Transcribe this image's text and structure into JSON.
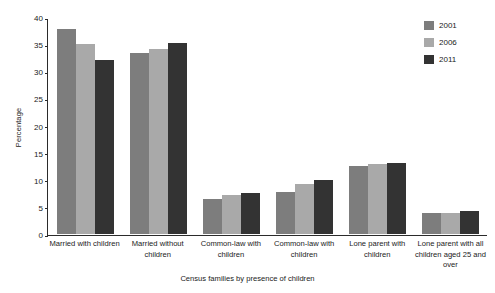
{
  "chart_data": {
    "type": "bar",
    "title": "",
    "xlabel": "Census families by presence of children",
    "ylabel": "Percentage",
    "ylim": [
      0,
      40
    ],
    "yticks": [
      0,
      5,
      10,
      15,
      20,
      25,
      30,
      35,
      40
    ],
    "grid": false,
    "legend_position": "top-right",
    "categories": [
      "Married with children",
      "Married without children",
      "Common-law with children",
      "Common-law with children",
      "Lone parent with children",
      "Lone parent with all children aged 25 and over"
    ],
    "series": [
      {
        "name": "2001",
        "color": "#7d7d7d",
        "values": [
          37.7,
          33.4,
          6.4,
          7.8,
          12.6,
          3.8
        ]
      },
      {
        "name": "2006",
        "color": "#a9a9a9",
        "values": [
          35.0,
          34.1,
          7.2,
          9.2,
          12.9,
          3.9
        ]
      },
      {
        "name": "2011",
        "color": "#333333",
        "values": [
          32.1,
          35.3,
          7.6,
          9.9,
          13.1,
          4.3
        ]
      }
    ]
  },
  "axis": {
    "y_title": "Percentage",
    "x_title": "Census families by presence of children",
    "y_tick_labels": [
      "0",
      "5",
      "10",
      "15",
      "20",
      "25",
      "30",
      "35",
      "40"
    ]
  },
  "legend": {
    "items": [
      {
        "label": "2001",
        "color": "#7d7d7d"
      },
      {
        "label": "2006",
        "color": "#a9a9a9"
      },
      {
        "label": "2011",
        "color": "#333333"
      }
    ]
  },
  "colors": {
    "axis": "#2b2b2b",
    "text": "#1a1a1a",
    "background": "#ffffff"
  }
}
